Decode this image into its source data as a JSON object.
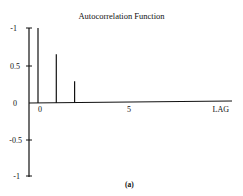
{
  "chart_data": {
    "type": "bar",
    "title": "Autocorrelation Function",
    "xlabel": "LAG",
    "ylabel": "",
    "caption": "(a)",
    "categories": [
      0,
      1,
      2
    ],
    "values": [
      1.0,
      0.65,
      0.29
    ],
    "x_ticks": [
      "0",
      "5"
    ],
    "y_ticks": [
      "-1",
      "0.5",
      "0",
      "-0.5",
      "-1"
    ],
    "ylim": [
      -1,
      1
    ],
    "xlim": [
      0,
      12
    ],
    "grid": false,
    "legend": null
  }
}
